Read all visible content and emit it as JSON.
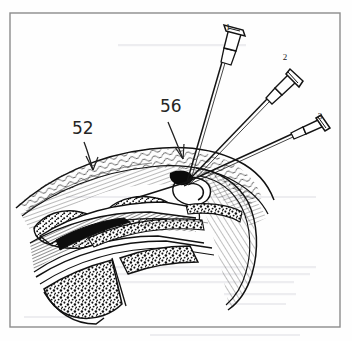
{
  "figure": {
    "type": "scanned-hand-annotated-line-drawing",
    "background_color": "#fefefe",
    "ink_color": "#1a1a1a",
    "border": {
      "color": "#8c8c8c",
      "x": 10,
      "y": 13,
      "width": 330,
      "height": 314,
      "stroke": 1.4
    },
    "needles": [
      {
        "id": "needle-1",
        "label": "1",
        "label_x": 228,
        "label_y": 30,
        "hub_x": 228,
        "hub_y": 45,
        "tip_x": 187,
        "tip_y": 182,
        "description": "steepest needle, hub at upper centre, syringe barrel with flanged plunger cap"
      },
      {
        "id": "needle-2",
        "label": "2",
        "label_x": 285,
        "label_y": 60,
        "hub_x": 277,
        "hub_y": 78,
        "tip_x": 187,
        "tip_y": 182,
        "description": "middle needle, hub upper right, oblique approach"
      },
      {
        "id": "needle-3",
        "label": "3",
        "label_x": 320,
        "label_y": 119,
        "hub_x": 305,
        "hub_y": 130,
        "tip_x": 187,
        "tip_y": 182,
        "description": "shallowest needle, hub at right, nearly tangential approach"
      }
    ],
    "annotations": [
      {
        "id": "annotation-52",
        "text": "52",
        "x": 72,
        "y": 134,
        "arrow_from_x": 84,
        "arrow_from_y": 142,
        "arrow_to_x": 92,
        "arrow_to_y": 168,
        "points_to": "superficial hatched dermal / subcutaneous layer"
      },
      {
        "id": "annotation-56",
        "text": "56",
        "x": 160,
        "y": 112,
        "arrow_from_x": 168,
        "arrow_from_y": 122,
        "arrow_to_x": 182,
        "arrow_to_y": 158,
        "points_to": "needle convergence / injection target point"
      }
    ],
    "tissue_layers": [
      {
        "name": "skin-dermis-layer",
        "pattern": "wavy-squiggle-hatch"
      },
      {
        "name": "subcutaneous-band",
        "pattern": "fine-parallel-hatch"
      },
      {
        "name": "fascial-cavity",
        "pattern": "outline-with-stipple-border"
      },
      {
        "name": "muscle-tendon-wedge",
        "pattern": "dense-parallel-lines"
      },
      {
        "name": "cortical-shell",
        "pattern": "double-outline"
      },
      {
        "name": "cancellous-bone",
        "pattern": "heavy-stipple"
      }
    ]
  }
}
